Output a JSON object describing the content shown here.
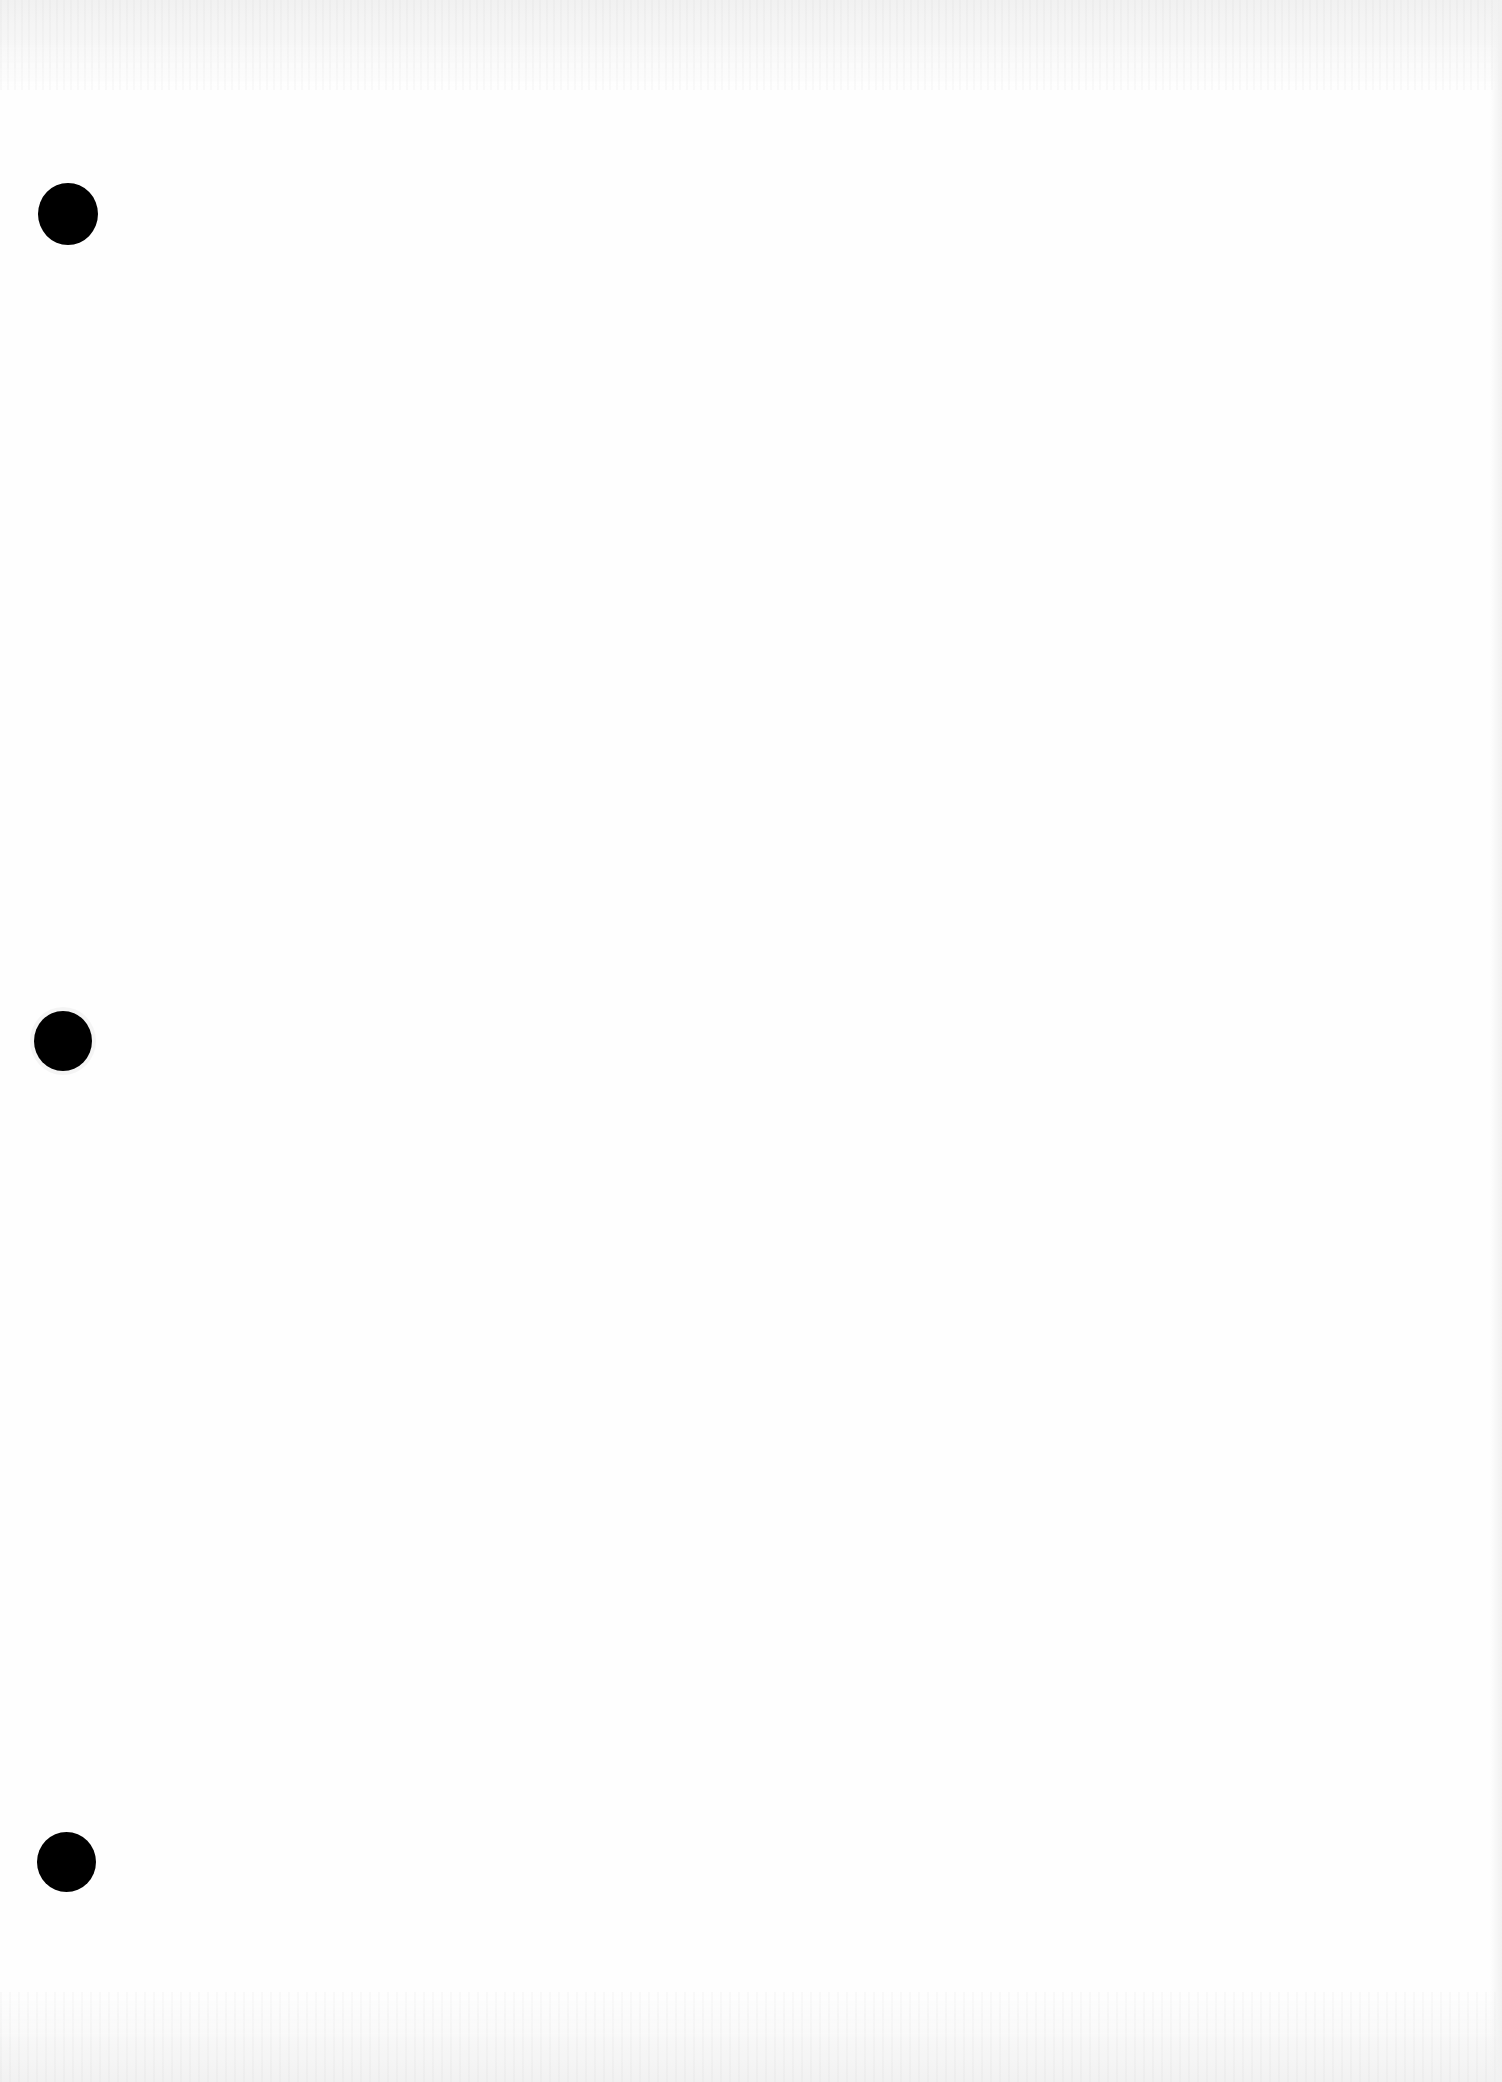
{
  "page": {
    "type": "scanned-blank-page",
    "background_color": "#fefefe",
    "text_content": "",
    "punch_holes": [
      {
        "position": "top",
        "color": "#000000"
      },
      {
        "position": "middle",
        "color": "#000000"
      },
      {
        "position": "bottom",
        "color": "#000000"
      }
    ]
  }
}
